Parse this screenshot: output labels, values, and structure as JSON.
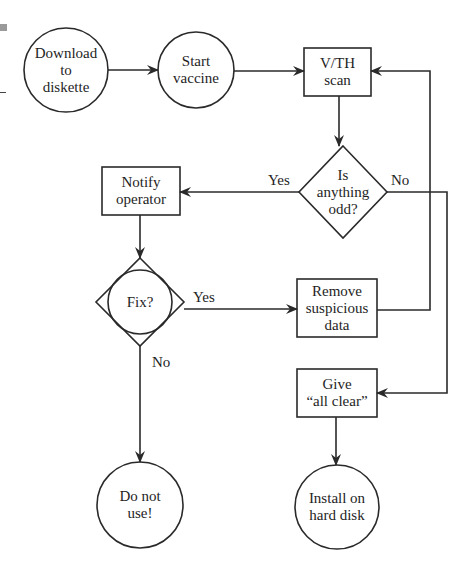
{
  "diagram": {
    "type": "flowchart",
    "nodes": {
      "download": {
        "shape": "circle",
        "lines": [
          "Download",
          "to",
          "diskette"
        ]
      },
      "start": {
        "shape": "circle",
        "lines": [
          "Start",
          "vaccine"
        ]
      },
      "scan": {
        "shape": "box",
        "lines": [
          "V/TH",
          "scan"
        ]
      },
      "odd": {
        "shape": "diamond",
        "lines": [
          "Is",
          "anything",
          "odd?"
        ]
      },
      "notify": {
        "shape": "box",
        "lines": [
          "Notify",
          "operator"
        ]
      },
      "fix": {
        "shape": "diamond-circle",
        "lines": [
          "Fix?"
        ]
      },
      "remove": {
        "shape": "box",
        "lines": [
          "Remove",
          "suspicious",
          "data"
        ]
      },
      "clear": {
        "shape": "box",
        "lines": [
          "Give",
          "“all clear”"
        ]
      },
      "donotuse": {
        "shape": "circle",
        "lines": [
          "Do not",
          "use!"
        ]
      },
      "install": {
        "shape": "circle",
        "lines": [
          "Install on",
          "hard disk"
        ]
      }
    },
    "edge_labels": {
      "odd_yes": "Yes",
      "odd_no": "No",
      "fix_yes": "Yes",
      "fix_no": "No"
    },
    "edges": [
      {
        "from": "download",
        "to": "start"
      },
      {
        "from": "start",
        "to": "scan"
      },
      {
        "from": "scan",
        "to": "odd"
      },
      {
        "from": "odd",
        "to": "notify",
        "label": "Yes"
      },
      {
        "from": "odd",
        "to": "clear",
        "label": "No"
      },
      {
        "from": "notify",
        "to": "fix"
      },
      {
        "from": "fix",
        "to": "remove",
        "label": "Yes"
      },
      {
        "from": "fix",
        "to": "donotuse",
        "label": "No"
      },
      {
        "from": "remove",
        "to": "scan"
      },
      {
        "from": "clear",
        "to": "install"
      }
    ],
    "colors": {
      "stroke": "#2a2a2a",
      "background": "#ffffff"
    }
  }
}
